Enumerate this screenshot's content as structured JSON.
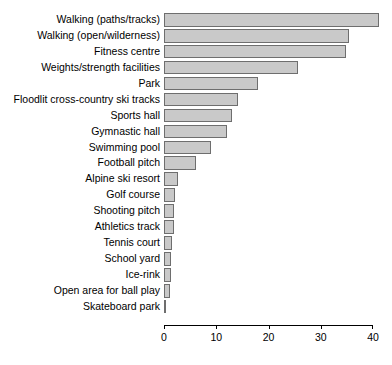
{
  "chart_data": {
    "type": "bar",
    "orientation": "horizontal",
    "title": "",
    "subtitle": "",
    "xlabel": "",
    "ylabel": "",
    "xlim": [
      0,
      40
    ],
    "xticks": [
      0,
      10,
      20,
      30,
      40
    ],
    "xticklabels": [
      "0",
      "10",
      "20",
      "30",
      "40"
    ],
    "grid": false,
    "legend": false,
    "bar_fill_color": "#c9c9c9",
    "bar_border_color": "#6e6e6e",
    "background_color": "#ffffff",
    "axis_color": "#000000",
    "categories": [
      "Walking (paths/tracks)",
      "Walking (open/wilderness)",
      "Fitness centre",
      "Weights/strength facilities",
      "Park",
      "Floodlit cross-country ski tracks",
      "Sports hall",
      "Gymnastic hall",
      "Swimming pool",
      "Football pitch",
      "Alpine ski resort",
      "Golf course",
      "Shooting pitch",
      "Athletics track",
      "Tennis court",
      "School yard",
      "Ice-rink",
      "Open area for ball play",
      "Skateboard park"
    ],
    "values": [
      41.2,
      35.5,
      34.9,
      25.6,
      17.9,
      14.2,
      13.1,
      12.1,
      9.0,
      6.1,
      2.6,
      2.1,
      2.0,
      1.9,
      1.5,
      1.4,
      1.3,
      1.2,
      0.3
    ]
  }
}
